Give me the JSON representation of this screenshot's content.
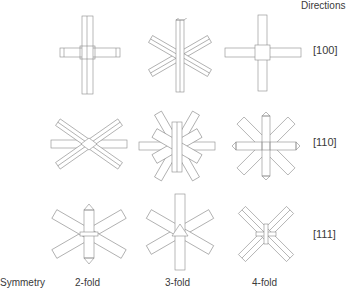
{
  "header": {
    "directions_label": "Directions"
  },
  "rows": [
    {
      "direction": "[100]"
    },
    {
      "direction": "[110]"
    },
    {
      "direction": "[111]"
    }
  ],
  "footer": {
    "symmetry_label": "Symmetry",
    "columns": [
      "2-fold",
      "3-fold",
      "4-fold"
    ]
  },
  "figures": [
    {
      "row": "[100]",
      "column": "2-fold",
      "icon": "cross-bars-icon"
    },
    {
      "row": "[100]",
      "column": "3-fold",
      "icon": "six-arm-star-icon"
    },
    {
      "row": "[100]",
      "column": "4-fold",
      "icon": "plus-bars-icon"
    },
    {
      "row": "[110]",
      "column": "2-fold",
      "icon": "six-arm-star-icon"
    },
    {
      "row": "[110]",
      "column": "3-fold",
      "icon": "twelve-arm-star-icon"
    },
    {
      "row": "[110]",
      "column": "4-fold",
      "icon": "eight-arm-star-icon"
    },
    {
      "row": "[111]",
      "column": "2-fold",
      "icon": "x-bars-icon"
    },
    {
      "row": "[111]",
      "column": "3-fold",
      "icon": "six-arm-star-icon"
    },
    {
      "row": "[111]",
      "column": "4-fold",
      "icon": "x-bars-icon"
    }
  ]
}
